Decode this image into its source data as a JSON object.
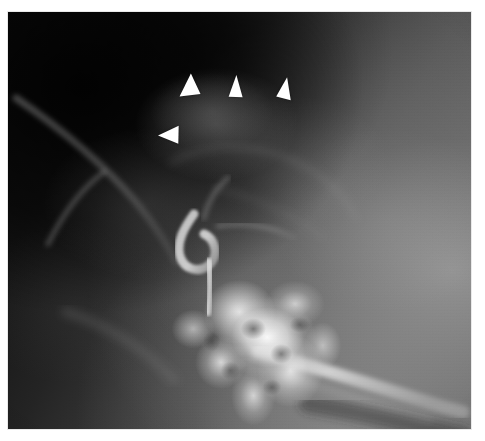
{
  "figure": {
    "modality": "cerebral angiogram",
    "projection": "lateral",
    "plate": {
      "x": 8,
      "y": 12,
      "width": 463,
      "height": 417,
      "background_color": "#3c3c3c",
      "page_background_color": "#ffffff"
    },
    "caption": "",
    "label": ""
  },
  "annotations": {
    "marker_color": "#ffffff",
    "marker_count": 4,
    "marker_shape": "solid-triangle-arrowhead",
    "purpose": "outline superior margin of vascular mass",
    "markers": [
      {
        "id": "arrowhead-1",
        "name": "arrowhead-upper-left",
        "x": 188,
        "y": 88,
        "size": 24,
        "rotation": -128,
        "direction": "down-left"
      },
      {
        "id": "arrowhead-2",
        "name": "arrowhead-upper-middle",
        "x": 234,
        "y": 84,
        "size": 23,
        "rotation": 2,
        "direction": "up"
      },
      {
        "id": "arrowhead-3",
        "name": "arrowhead-upper-right",
        "x": 283,
        "y": 86,
        "size": 23,
        "rotation": 11,
        "direction": "up-right"
      },
      {
        "id": "arrowhead-4",
        "name": "arrowhead-lower-left",
        "x": 168,
        "y": 134,
        "size": 24,
        "rotation": -92,
        "direction": "left"
      }
    ]
  },
  "anatomy": {
    "regions": [
      {
        "name": "cranial-vault-shadow",
        "tone": "very-dark",
        "location": "upper-left"
      },
      {
        "name": "mass-blush",
        "tone": "faint-light",
        "location": "upper-center"
      },
      {
        "name": "carotid-siphon",
        "tone": "light",
        "location": "center-left"
      },
      {
        "name": "skull-base-petrous-cluster",
        "tone": "bright-mottled",
        "location": "lower-center"
      },
      {
        "name": "cervical-carotid",
        "tone": "bright-band",
        "location": "lower-right"
      },
      {
        "name": "soft-tissue-field",
        "tone": "mid-gray",
        "location": "right"
      }
    ]
  }
}
